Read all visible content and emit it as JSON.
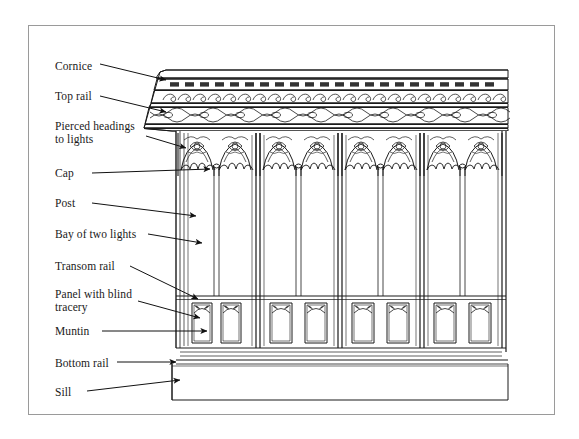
{
  "figure": {
    "type": "annotated-architectural-drawing",
    "background_color": "#ffffff",
    "border_color": "#9a9a9a",
    "ink_color": "#1a1a1a"
  },
  "labels": [
    {
      "id": "cornice",
      "text": "Cornice",
      "x": 55,
      "y": 60
    },
    {
      "id": "top-rail",
      "text": "Top rail",
      "x": 55,
      "y": 90
    },
    {
      "id": "pierced-heads",
      "text": "Pierced headings\nto lights",
      "x": 55,
      "y": 120
    },
    {
      "id": "cap",
      "text": "Cap",
      "x": 55,
      "y": 168
    },
    {
      "id": "post",
      "text": "Post",
      "x": 55,
      "y": 199
    },
    {
      "id": "bay-two-lights",
      "text": "Bay of two lights",
      "x": 55,
      "y": 230
    },
    {
      "id": "transom-rail",
      "text": "Transom rail",
      "x": 55,
      "y": 262
    },
    {
      "id": "panel-blind",
      "text": "Panel with blind\ntracery",
      "x": 55,
      "y": 288
    },
    {
      "id": "muntin",
      "text": "Muntin",
      "x": 55,
      "y": 327
    },
    {
      "id": "bottom-rail",
      "text": "Bottom rail",
      "x": 55,
      "y": 359
    },
    {
      "id": "sill",
      "text": "Sill",
      "x": 55,
      "y": 388
    }
  ],
  "leader_lines": [
    {
      "id": "cornice",
      "x1": 100,
      "y1": 64,
      "x2": 168,
      "y2": 80
    },
    {
      "id": "top-rail",
      "x1": 100,
      "y1": 96,
      "x2": 168,
      "y2": 111
    },
    {
      "id": "pierced-heads",
      "x1": 146,
      "y1": 136,
      "x2": 183,
      "y2": 148
    },
    {
      "id": "cap",
      "x1": 90,
      "y1": 173,
      "x2": 196,
      "y2": 176
    },
    {
      "id": "post",
      "x1": 90,
      "y1": 203,
      "x2": 196,
      "y2": 216
    },
    {
      "id": "bay-two-lights",
      "x1": 146,
      "y1": 234,
      "x2": 200,
      "y2": 243
    },
    {
      "id": "transom-rail",
      "x1": 128,
      "y1": 266,
      "x2": 196,
      "y2": 298
    },
    {
      "id": "panel-blind",
      "x1": 136,
      "y1": 301,
      "x2": 198,
      "y2": 316
    },
    {
      "id": "muntin",
      "x1": 100,
      "y1": 331,
      "x2": 203,
      "y2": 331
    },
    {
      "id": "bottom-rail",
      "x1": 115,
      "y1": 363,
      "x2": 178,
      "y2": 363
    },
    {
      "id": "sill",
      "x1": 85,
      "y1": 391,
      "x2": 180,
      "y2": 381
    }
  ],
  "structure": {
    "bays": 4,
    "lights_per_bay": 2,
    "total_lights": 8,
    "panels_left_bay": 2,
    "panels_right_section": 4,
    "cornice_bands": [
      "dentil blocks",
      "scroll / vine frieze",
      "wave and disc band",
      "fillet moulding"
    ]
  }
}
